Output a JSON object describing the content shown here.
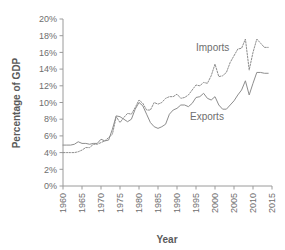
{
  "chart_data": {
    "type": "line",
    "title": "",
    "xlabel": "Year",
    "ylabel": "Percentage of GDP",
    "xlim": [
      1960,
      2015
    ],
    "ylim": [
      0,
      20
    ],
    "ytick_labels": [
      "0%",
      "2%",
      "4%",
      "6%",
      "8%",
      "10%",
      "12%",
      "14%",
      "16%",
      "18%",
      "20%"
    ],
    "ytick_values": [
      0,
      2,
      4,
      6,
      8,
      10,
      12,
      14,
      16,
      18,
      20
    ],
    "xtick_labels": [
      "1960",
      "1965",
      "1970",
      "1975",
      "1980",
      "1985",
      "1990",
      "1995",
      "2000",
      "2005",
      "2010",
      "2015"
    ],
    "xtick_values": [
      1960,
      1965,
      1970,
      1975,
      1980,
      1985,
      1990,
      1995,
      2000,
      2005,
      2010,
      2015
    ],
    "grid": false,
    "legend_position": "inline-annotation",
    "x": [
      1960,
      1961,
      1962,
      1963,
      1964,
      1965,
      1966,
      1967,
      1968,
      1969,
      1970,
      1971,
      1972,
      1973,
      1974,
      1975,
      1976,
      1977,
      1978,
      1979,
      1980,
      1981,
      1982,
      1983,
      1984,
      1985,
      1986,
      1987,
      1988,
      1989,
      1990,
      1991,
      1992,
      1993,
      1994,
      1995,
      1996,
      1997,
      1998,
      1999,
      2000,
      2001,
      2002,
      2003,
      2004,
      2005,
      2006,
      2007,
      2008,
      2009,
      2010,
      2011,
      2012,
      2013,
      2014
    ],
    "series": [
      {
        "name": "Imports",
        "style": "dotted",
        "color": "#8d8d8d",
        "values": [
          4.0,
          4.0,
          4.0,
          4.0,
          4.1,
          4.3,
          4.6,
          4.6,
          5.0,
          5.0,
          5.2,
          5.4,
          5.8,
          6.2,
          8.3,
          7.6,
          8.2,
          8.7,
          8.6,
          9.4,
          10.3,
          9.9,
          9.1,
          9.1,
          10.0,
          9.8,
          10.0,
          10.5,
          10.7,
          10.7,
          11.0,
          10.5,
          10.6,
          10.9,
          11.5,
          12.1,
          12.0,
          12.4,
          12.3,
          13.2,
          14.6,
          13.1,
          13.2,
          13.6,
          14.8,
          15.6,
          16.4,
          16.5,
          17.6,
          13.9,
          16.0,
          17.6,
          17.1,
          16.6,
          16.6
        ]
      },
      {
        "name": "Exports",
        "style": "solid",
        "color": "#8d8d8d",
        "values": [
          4.9,
          4.9,
          4.9,
          5.0,
          5.3,
          5.1,
          5.1,
          5.0,
          5.1,
          5.1,
          5.6,
          5.4,
          5.5,
          6.8,
          8.4,
          8.3,
          8.0,
          7.7,
          8.0,
          9.2,
          10.0,
          9.6,
          8.6,
          7.6,
          7.1,
          6.9,
          7.1,
          7.4,
          8.6,
          9.1,
          9.3,
          9.7,
          9.7,
          9.5,
          9.9,
          10.6,
          10.7,
          11.1,
          10.5,
          10.3,
          10.7,
          9.7,
          9.2,
          9.2,
          9.7,
          10.2,
          10.9,
          11.5,
          12.6,
          10.9,
          12.3,
          13.6,
          13.6,
          13.5,
          13.5
        ]
      }
    ],
    "annotations": [
      {
        "text": "Imports",
        "x_px": 196,
        "y_px": 51
      },
      {
        "text": "Exports",
        "x_px": 190,
        "y_px": 120
      }
    ]
  },
  "plot_geometry": {
    "left_px": 63,
    "right_px": 272,
    "top_px": 19,
    "bottom_px": 186
  }
}
